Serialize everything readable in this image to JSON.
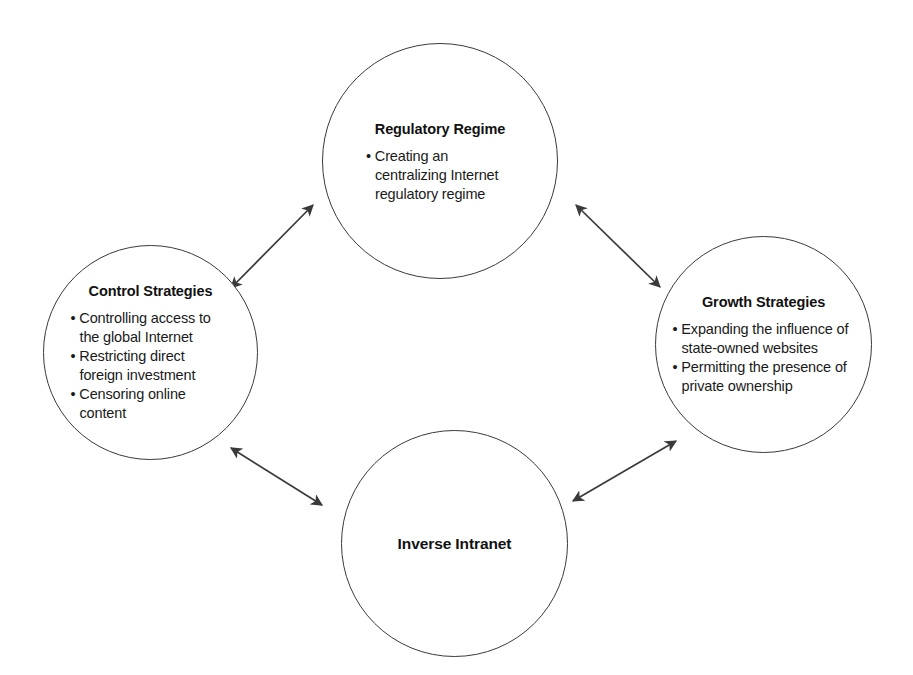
{
  "diagram": {
    "title": "Inverse Intranet",
    "background_color": "#ffffff",
    "stroke_color": "#3a3a3a",
    "text_color": "#1a1a1a",
    "nodes": [
      {
        "id": "regulatory-regime",
        "title": "Regulatory Regime",
        "bullets": [
          "Creating an centralizing Internet regulatory regime"
        ]
      },
      {
        "id": "control-strategies",
        "title": "Control Strategies",
        "bullets": [
          "Controlling access to the global Internet",
          "Restricting direct foreign investment",
          "Censoring online content"
        ]
      },
      {
        "id": "growth-strategies",
        "title": "Growth Strategies",
        "bullets": [
          "Expanding the influence of state-owned websites",
          "Permitting the presence of private ownership"
        ]
      },
      {
        "id": "inverse-intranet",
        "title": "Inverse Intranet",
        "bullets": []
      }
    ],
    "connectors": [
      {
        "id": "control-to-regulatory",
        "from": "control-strategies",
        "to": "regulatory-regime",
        "style": "double-headed-arrow"
      },
      {
        "id": "regulatory-to-growth",
        "from": "regulatory-regime",
        "to": "growth-strategies",
        "style": "double-headed-arrow"
      },
      {
        "id": "control-to-inverse",
        "from": "control-strategies",
        "to": "inverse-intranet",
        "style": "double-headed-arrow"
      },
      {
        "id": "inverse-to-growth",
        "from": "inverse-intranet",
        "to": "growth-strategies",
        "style": "double-headed-arrow"
      }
    ]
  }
}
